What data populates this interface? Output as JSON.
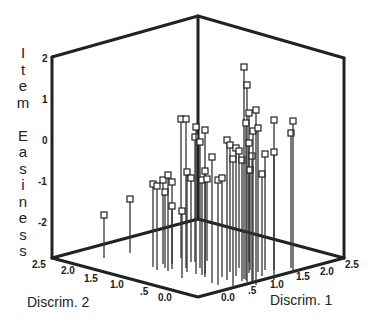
{
  "chart_data": {
    "type": "scatter3d",
    "style": "drop-lines (stems) from floor to square markers",
    "zlabel": "Item Easiness",
    "xlabel": "Discrim. 1",
    "ylabel": "Discrim. 2",
    "z_ticks": [
      "2",
      "1",
      "0",
      "-1",
      "-2"
    ],
    "x_ticks": [
      "0.0",
      ".5",
      "1.0",
      "1.5",
      "2.0",
      "2.5"
    ],
    "y_ticks": [
      "2.5",
      "2.0",
      "1.5",
      "1.0",
      ".5",
      "0.0"
    ],
    "zlim": [
      -2.85,
      2.0
    ],
    "xlim": [
      0.0,
      2.5
    ],
    "ylim": [
      0.0,
      2.5
    ],
    "grid": false,
    "legend": null,
    "points_px": [
      {
        "x": 104,
        "top": 215,
        "bottom": 258
      },
      {
        "x": 130,
        "top": 199,
        "bottom": 253
      },
      {
        "x": 153,
        "top": 184,
        "bottom": 267
      },
      {
        "x": 157,
        "top": 186,
        "bottom": 270
      },
      {
        "x": 163,
        "top": 180,
        "bottom": 264
      },
      {
        "x": 165,
        "top": 192,
        "bottom": 268
      },
      {
        "x": 168,
        "top": 175,
        "bottom": 271
      },
      {
        "x": 172,
        "top": 182,
        "bottom": 264
      },
      {
        "x": 172,
        "top": 206,
        "bottom": 269
      },
      {
        "x": 181,
        "top": 119,
        "bottom": 258
      },
      {
        "x": 186,
        "top": 119,
        "bottom": 268
      },
      {
        "x": 182,
        "top": 211,
        "bottom": 278
      },
      {
        "x": 187,
        "top": 172,
        "bottom": 272
      },
      {
        "x": 191,
        "top": 178,
        "bottom": 262
      },
      {
        "x": 195,
        "top": 137,
        "bottom": 262
      },
      {
        "x": 196,
        "top": 127,
        "bottom": 274
      },
      {
        "x": 200,
        "top": 142,
        "bottom": 268
      },
      {
        "x": 202,
        "top": 180,
        "bottom": 275
      },
      {
        "x": 205,
        "top": 130,
        "bottom": 274
      },
      {
        "x": 205,
        "top": 171,
        "bottom": 277
      },
      {
        "x": 207,
        "top": 179,
        "bottom": 261
      },
      {
        "x": 212,
        "top": 157,
        "bottom": 283
      },
      {
        "x": 218,
        "top": 180,
        "bottom": 285
      },
      {
        "x": 222,
        "top": 178,
        "bottom": 277
      },
      {
        "x": 227,
        "top": 140,
        "bottom": 280
      },
      {
        "x": 230,
        "top": 145,
        "bottom": 272
      },
      {
        "x": 233,
        "top": 159,
        "bottom": 286
      },
      {
        "x": 236,
        "top": 148,
        "bottom": 276
      },
      {
        "x": 239,
        "top": 151,
        "bottom": 268
      },
      {
        "x": 242,
        "top": 160,
        "bottom": 281
      },
      {
        "x": 244,
        "top": 67,
        "bottom": 279
      },
      {
        "x": 247,
        "top": 85,
        "bottom": 282
      },
      {
        "x": 246,
        "top": 123,
        "bottom": 280
      },
      {
        "x": 249,
        "top": 113,
        "bottom": 273
      },
      {
        "x": 249,
        "top": 143,
        "bottom": 262
      },
      {
        "x": 250,
        "top": 170,
        "bottom": 270
      },
      {
        "x": 252,
        "top": 156,
        "bottom": 281
      },
      {
        "x": 253,
        "top": 131,
        "bottom": 283
      },
      {
        "x": 256,
        "top": 110,
        "bottom": 285
      },
      {
        "x": 258,
        "top": 128,
        "bottom": 272
      },
      {
        "x": 262,
        "top": 174,
        "bottom": 276
      },
      {
        "x": 265,
        "top": 154,
        "bottom": 270
      },
      {
        "x": 274,
        "top": 120,
        "bottom": 270
      },
      {
        "x": 274,
        "top": 152,
        "bottom": 280
      },
      {
        "x": 291,
        "top": 133,
        "bottom": 268
      },
      {
        "x": 293,
        "top": 121,
        "bottom": 273
      }
    ]
  },
  "labels": {
    "zlabel_letters": [
      "I",
      "t",
      "e",
      "m",
      "",
      "E",
      "a",
      "s",
      "i",
      "n",
      "e",
      "s",
      "s"
    ],
    "xlabel": "Discrim. 1",
    "ylabel": "Discrim. 2"
  }
}
